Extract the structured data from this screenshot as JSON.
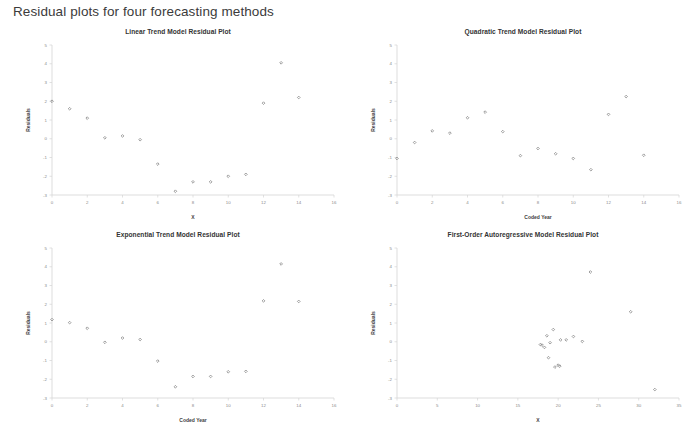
{
  "page": {
    "title": "Residual plots for four forecasting methods",
    "background_color": "#ffffff",
    "marker_color": "#808080",
    "axis_color": "#d4d4d4"
  },
  "chart_data": [
    {
      "id": "linear-trend",
      "type": "scatter",
      "title": "Linear Trend Model Residual Plot",
      "xlabel": "X",
      "ylabel": "Residuals",
      "xlim": [
        0,
        16
      ],
      "ylim": [
        -3,
        5
      ],
      "xticks": [
        0,
        2,
        4,
        6,
        8,
        10,
        12,
        14,
        16
      ],
      "yticks": [
        -3,
        -2,
        -1,
        0,
        1,
        2,
        3,
        4,
        5
      ],
      "grid": false,
      "legend": "none",
      "marker": "diamond",
      "x": [
        0,
        1,
        2,
        3,
        4,
        5,
        6,
        7,
        8,
        9,
        10,
        11,
        12,
        13,
        14
      ],
      "y": [
        2.0,
        1.6,
        1.1,
        0.05,
        0.15,
        -0.05,
        -1.35,
        -2.8,
        -2.3,
        -2.3,
        -2.0,
        -1.9,
        1.9,
        4.05,
        2.2
      ]
    },
    {
      "id": "quadratic-trend",
      "type": "scatter",
      "title": "Quadratic Trend Model Residual Plot",
      "xlabel": "Coded Year",
      "ylabel": "Residuals",
      "xlim": [
        0,
        16
      ],
      "ylim": [
        -3,
        5
      ],
      "xticks": [
        0,
        2,
        4,
        6,
        8,
        10,
        12,
        14,
        16
      ],
      "yticks": [
        -3,
        -2,
        -1,
        0,
        1,
        2,
        3,
        4,
        5
      ],
      "grid": false,
      "legend": "none",
      "marker": "diamond",
      "x": [
        0,
        1,
        2,
        3,
        4,
        5,
        6,
        7,
        8,
        9,
        10,
        11,
        12,
        13,
        14
      ],
      "y": [
        -1.05,
        -0.2,
        0.42,
        0.3,
        1.12,
        1.42,
        0.38,
        -0.9,
        -0.52,
        -0.8,
        -1.05,
        -1.65,
        1.3,
        2.25,
        -0.88
      ]
    },
    {
      "id": "exponential-trend",
      "type": "scatter",
      "title": "Exponential Trend Model Residual Plot",
      "xlabel": "Coded Year",
      "ylabel": "Residuals",
      "xlim": [
        0,
        16
      ],
      "ylim": [
        -3,
        5
      ],
      "xticks": [
        0,
        2,
        4,
        6,
        8,
        10,
        12,
        14,
        16
      ],
      "yticks": [
        -3,
        -2,
        -1,
        0,
        1,
        2,
        3,
        4,
        5
      ],
      "grid": false,
      "legend": "none",
      "marker": "diamond",
      "x": [
        0,
        1,
        2,
        3,
        4,
        5,
        6,
        7,
        8,
        9,
        10,
        11,
        12,
        13,
        14
      ],
      "y": [
        1.18,
        1.02,
        0.72,
        -0.03,
        0.2,
        0.12,
        -1.03,
        -2.4,
        -1.85,
        -1.85,
        -1.6,
        -1.58,
        2.18,
        4.15,
        2.15
      ]
    },
    {
      "id": "first-order-autoregressive",
      "type": "scatter",
      "title": "First-Order Autoregressive Model Residual Plot",
      "xlabel": "X",
      "ylabel": "Residuals",
      "xlim": [
        0,
        35
      ],
      "ylim": [
        -3,
        5
      ],
      "xticks": [
        0,
        5,
        10,
        15,
        20,
        25,
        30,
        35
      ],
      "yticks": [
        -3,
        -2,
        -1,
        0,
        1,
        2,
        3,
        4,
        5
      ],
      "grid": false,
      "legend": "none",
      "marker": "diamond",
      "x": [
        17.8,
        18.0,
        18.3,
        18.6,
        18.8,
        19.0,
        19.4,
        19.6,
        20.0,
        20.2,
        20.3,
        21.0,
        21.9,
        23.0,
        24.0,
        29.0,
        32.0
      ],
      "y": [
        -0.15,
        -0.18,
        -0.3,
        0.32,
        -0.85,
        -0.05,
        0.65,
        -1.35,
        -1.25,
        -1.3,
        0.1,
        0.1,
        0.28,
        0.02,
        3.72,
        1.6,
        -2.55
      ]
    }
  ]
}
